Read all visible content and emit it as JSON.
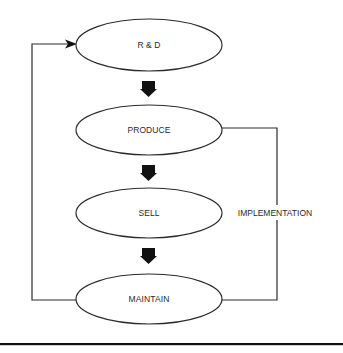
{
  "diagram": {
    "type": "flowchart",
    "colors": {
      "background": "#ffffff",
      "stroke": "#2b2b2b",
      "text": "#2a2a2a",
      "block_arrow": "#111111",
      "rule": "#111111"
    },
    "nodes": [
      {
        "id": "rd",
        "label": "R & D",
        "shape": "ellipse"
      },
      {
        "id": "produce",
        "label": "PRODUCE",
        "shape": "ellipse"
      },
      {
        "id": "sell",
        "label": "SELL",
        "shape": "ellipse"
      },
      {
        "id": "maintain",
        "label": "MAINTAIN",
        "shape": "ellipse"
      }
    ],
    "edges": [
      {
        "from": "rd",
        "to": "produce",
        "style": "block-arrow"
      },
      {
        "from": "produce",
        "to": "sell",
        "style": "block-arrow"
      },
      {
        "from": "sell",
        "to": "maintain",
        "style": "block-arrow"
      },
      {
        "from": "maintain",
        "to": "rd",
        "style": "line-arrow",
        "route": "left-loop"
      },
      {
        "from": "produce",
        "to": "maintain",
        "style": "line",
        "route": "right-loop",
        "label": "IMPLEMENTATION"
      }
    ]
  }
}
